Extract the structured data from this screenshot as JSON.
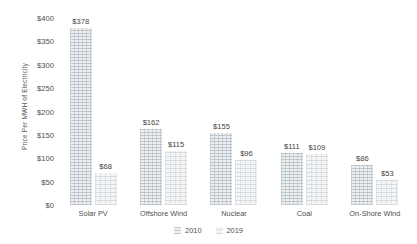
{
  "chart_data": {
    "type": "bar",
    "title": "",
    "xlabel": "",
    "ylabel": "Price Per MWH of Electricity",
    "ylim": [
      0,
      400
    ],
    "grid": false,
    "legend_position": "bottom",
    "categories": [
      "Solar PV",
      "Offshore Wind",
      "Nuclear",
      "Coal",
      "On-Shore Wind"
    ],
    "ytick_labels": [
      "$400",
      "$350",
      "$300",
      "$250",
      "$200",
      "$150",
      "$100",
      "$50",
      "$0"
    ],
    "ytick_values": [
      400,
      350,
      300,
      250,
      200,
      150,
      100,
      50,
      0
    ],
    "series": [
      {
        "name": "2010",
        "values": [
          378,
          162,
          155,
          111,
          86
        ],
        "value_labels": [
          "$378",
          "$162",
          "$155",
          "$111",
          "$86"
        ],
        "color": "#eceff1"
      },
      {
        "name": "2019",
        "values": [
          68,
          115,
          96,
          109,
          53
        ],
        "value_labels": [
          "$68",
          "$115",
          "$96",
          "$109",
          "$53"
        ],
        "color": "#f3f5f6"
      }
    ]
  }
}
